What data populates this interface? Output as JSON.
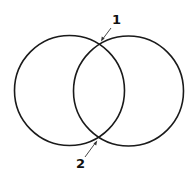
{
  "diagram": {
    "type": "two overlapping circles",
    "stroke_color": "#1a1a1a",
    "background": "#ffffff",
    "circles": [
      {
        "name": "left-circle",
        "cx": 69.5,
        "cy": 90.5,
        "r": 55
      },
      {
        "name": "right-circle",
        "cx": 128.5,
        "cy": 91,
        "r": 55
      }
    ],
    "labels": [
      {
        "text": "1",
        "x": 112,
        "y": 24,
        "points_to": "upper-intersection"
      },
      {
        "text": "2",
        "x": 76,
        "y": 168,
        "points_to": "lower-intersection"
      }
    ]
  }
}
